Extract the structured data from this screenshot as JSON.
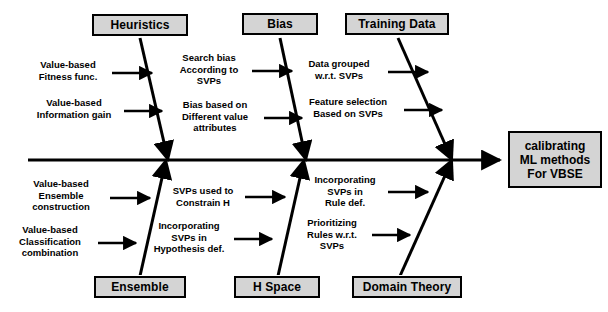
{
  "diagram": {
    "type": "fishbone-ishikawa",
    "effect": {
      "label": "calibrating ML methods For VBSE",
      "lines": [
        "calibrating",
        "ML methods",
        "For VBSE"
      ]
    },
    "spine": {
      "color": "#000000",
      "direction": "left-to-right"
    },
    "box_fill": "#d4d4d4",
    "box_border": "#000000",
    "categories": [
      {
        "id": "heuristics",
        "label": "Heuristics",
        "position": "top",
        "causes": [
          {
            "id": "value-based-fitness-func",
            "lines": [
              "Value-based",
              "Fitness func."
            ]
          },
          {
            "id": "value-based-information-gain",
            "lines": [
              "Value-based",
              "Information gain"
            ]
          }
        ]
      },
      {
        "id": "bias",
        "label": "Bias",
        "position": "top",
        "causes": [
          {
            "id": "search-bias-according-to-svps",
            "lines": [
              "Search bias",
              "According to",
              "SVPs"
            ]
          },
          {
            "id": "bias-based-on-different-value-attributes",
            "lines": [
              "Bias based on",
              "Different value",
              "attributes"
            ]
          }
        ]
      },
      {
        "id": "training-data",
        "label": "Training Data",
        "position": "top",
        "causes": [
          {
            "id": "data-grouped-wrt-svps",
            "lines": [
              "Data grouped",
              "w.r.t. SVPs"
            ]
          },
          {
            "id": "feature-selection-based-on-svps",
            "lines": [
              "Feature  selection",
              "Based on SVPs"
            ]
          }
        ]
      },
      {
        "id": "ensemble",
        "label": "Ensemble",
        "position": "bottom",
        "causes": [
          {
            "id": "value-based-ensemble-construction",
            "lines": [
              "Value-based",
              "Ensemble",
              "construction"
            ]
          },
          {
            "id": "value-based-classification-combination",
            "lines": [
              "Value-based",
              "Classification",
              "combination"
            ]
          }
        ]
      },
      {
        "id": "h-space",
        "label": "H Space",
        "position": "bottom",
        "causes": [
          {
            "id": "svps-used-to-constrain-h",
            "lines": [
              "SVPs used to",
              "Constrain H"
            ]
          },
          {
            "id": "incorporating-svps-in-hypothesis-def",
            "lines": [
              "Incorporating",
              "SVPs in",
              "Hypothesis def."
            ]
          }
        ]
      },
      {
        "id": "domain-theory",
        "label": "Domain Theory",
        "position": "bottom",
        "causes": [
          {
            "id": "incorporating-svps-in-rule-def",
            "lines": [
              "Incorporating",
              "SVPs in",
              "Rule def."
            ]
          },
          {
            "id": "prioritizing-rules-wrt-svps",
            "lines": [
              "Prioritizing",
              "Rules w.r.t.",
              "SVPs"
            ]
          }
        ]
      }
    ]
  }
}
